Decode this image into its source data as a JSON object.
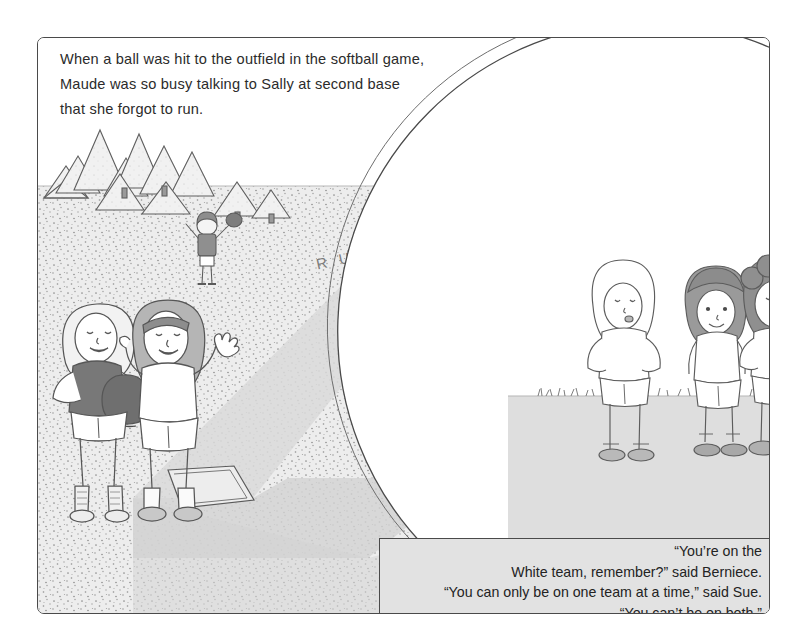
{
  "page": {
    "background_color": "#ffffff"
  },
  "frame": {
    "border_color": "#4a4a4a"
  },
  "caption_top": {
    "lines": [
      "When a ball was hit to the outfield in the softball game,",
      "Maude was so busy talking to Sally at second base",
      "that she forgot to run."
    ]
  },
  "scene": {
    "field_color": "#ededed",
    "basepath_color": "#d6d6d6",
    "sky_color": "#ffffff",
    "handwritten_text": "R U N !",
    "trees_label": "pine-tree-row",
    "base_label": "second-base-bag",
    "characters": [
      {
        "name": "sally",
        "shirt": "dark",
        "description": "blonde girl in dark shirt holding mitt"
      },
      {
        "name": "maude",
        "shirt": "white",
        "description": "girl with headband talking, arms raised"
      },
      {
        "name": "runner",
        "shirt": "white",
        "description": "girl with pigtails running"
      },
      {
        "name": "fielder-near",
        "shirt": "dark",
        "description": "girl in dark shirt with mitt raised"
      },
      {
        "name": "fielder-far",
        "shirt": "dark",
        "description": "distant fielder with arms up"
      }
    ]
  },
  "inset": {
    "label": "circular-inset-panel",
    "ground_color": "#dcdcdc",
    "characters": [
      {
        "name": "berniece",
        "description": "girl with long light hair, hands on hips"
      },
      {
        "name": "sue",
        "description": "girl with dark bobbed hair, arms at sides"
      },
      {
        "name": "third-girl",
        "description": "girl with curly dark hair, hands on hips"
      }
    ]
  },
  "dialogue": {
    "background_color": "#e2e2e2",
    "lines": [
      "“You’re on the",
      "White team, remember?” said Berniece.",
      "“You can only be on one team at a time,” said Sue.",
      "“You can’t be on both.”"
    ]
  }
}
